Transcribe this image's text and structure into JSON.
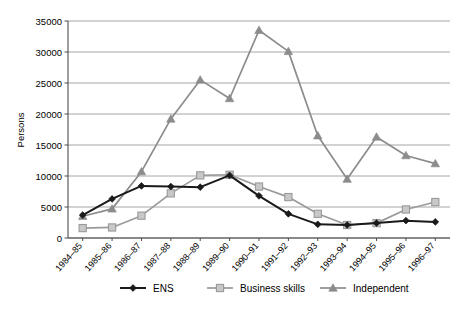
{
  "chart_data": {
    "type": "line",
    "title": "",
    "xlabel": "",
    "ylabel": "Persons",
    "ylim": [
      0,
      35000
    ],
    "ytick_step": 5000,
    "yticks": [
      "0",
      "5000",
      "10000",
      "15000",
      "20000",
      "25000",
      "30000",
      "35000"
    ],
    "grid": true,
    "legend_position": "bottom",
    "categories": [
      "1984–85",
      "1985–86",
      "1986–87",
      "1987–88",
      "1988–89",
      "1989–90",
      "1990–91",
      "1991–92",
      "1992–93",
      "1993–94",
      "1994–95",
      "1995–96",
      "1996–97"
    ],
    "series": [
      {
        "name": "ENS",
        "color": "#1a1a1a",
        "marker": "diamond",
        "values": [
          3700,
          6300,
          8400,
          8300,
          8200,
          10100,
          6800,
          3900,
          2200,
          2100,
          2400,
          2800,
          2600
        ]
      },
      {
        "name": "Business skills",
        "color": "#9a9a9a",
        "marker": "square",
        "values": [
          1600,
          1700,
          3600,
          7200,
          10100,
          10200,
          8300,
          6600,
          3900,
          2100,
          2400,
          4600,
          5800
        ]
      },
      {
        "name": "Independent",
        "color": "#8c8c8c",
        "marker": "triangle",
        "values": [
          3500,
          4700,
          10700,
          19200,
          25500,
          22500,
          33500,
          30100,
          16500,
          9500,
          16300,
          13300,
          12000
        ]
      }
    ]
  },
  "legend": {
    "items": [
      {
        "label": "ENS"
      },
      {
        "label": "Business skills"
      },
      {
        "label": "Independent"
      }
    ]
  },
  "axes": {
    "y_title": "Persons"
  },
  "colors": {
    "ens": "#1a1a1a",
    "business_skills": "#9a9a9a",
    "independent": "#8c8c8c",
    "grid": "#8f8f8f",
    "axis": "#4d4d4d",
    "background": "#ffffff"
  }
}
